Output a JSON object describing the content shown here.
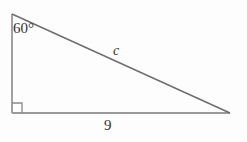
{
  "figure": {
    "type": "right-triangle-diagram",
    "background_color": "#fdfdfd",
    "stroke_color": "#808080",
    "text_color": "#333333",
    "labels": {
      "angle": "60°",
      "hypotenuse": "c",
      "base": "9"
    },
    "geometry": {
      "apex_top_left": [
        12,
        14
      ],
      "vertex_bottom_left": [
        12,
        113
      ],
      "vertex_bottom_right": [
        230,
        113
      ],
      "right_angle_marker": {
        "x": 12,
        "y": 103,
        "size": 10
      }
    }
  }
}
